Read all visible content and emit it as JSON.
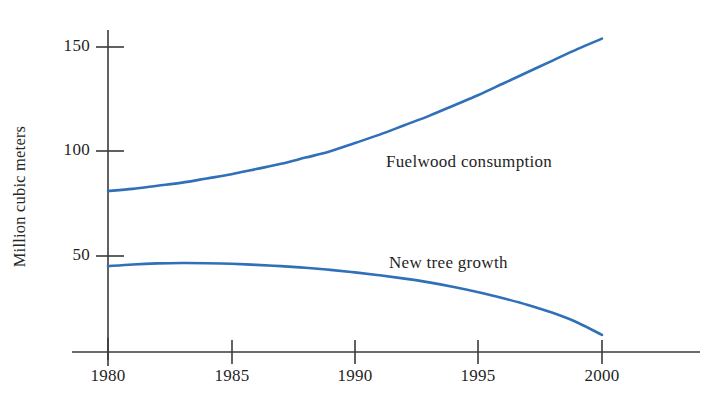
{
  "chart_data": {
    "type": "line",
    "title": "",
    "subtitle": "",
    "xlabel": "",
    "ylabel": "Million cubic meters",
    "x": [
      1980,
      1981,
      1982,
      1983,
      1984,
      1985,
      1986,
      1987,
      1988,
      1989,
      1990,
      1991,
      1992,
      1993,
      1994,
      1995,
      1996,
      1997,
      1998,
      1999,
      2000
    ],
    "xlim": [
      1980,
      2000
    ],
    "ylim": [
      0,
      165
    ],
    "xticks": [
      1980,
      1985,
      1990,
      1995,
      2000
    ],
    "xtick_labels": [
      "1980",
      "1985",
      "1990",
      "1995",
      "2000"
    ],
    "yticks": [
      50,
      100,
      150
    ],
    "ytick_labels": [
      "50",
      "100",
      "150"
    ],
    "grid": false,
    "legend_position": "inline-annotations",
    "line_color": "#3070b8",
    "axis_color": "#3a3a3a",
    "series": [
      {
        "name": "Fuelwood consumption",
        "label_position": "inline",
        "values": [
          81,
          82,
          83.5,
          85,
          87,
          89,
          91.5,
          94,
          97,
          100,
          104,
          108,
          112.5,
          117,
          122,
          127,
          132.5,
          138,
          143.5,
          149,
          154
        ]
      },
      {
        "name": "New tree growth",
        "label_position": "inline",
        "values": [
          45,
          45.8,
          46.3,
          46.5,
          46.4,
          46.1,
          45.6,
          45,
          44.2,
          43.2,
          42,
          40.6,
          39,
          37.2,
          35,
          32.5,
          29.6,
          26.4,
          22.6,
          18,
          12
        ]
      }
    ]
  },
  "annotations": {
    "fuelwood_label": "Fuelwood consumption",
    "tree_label": "New tree growth"
  }
}
